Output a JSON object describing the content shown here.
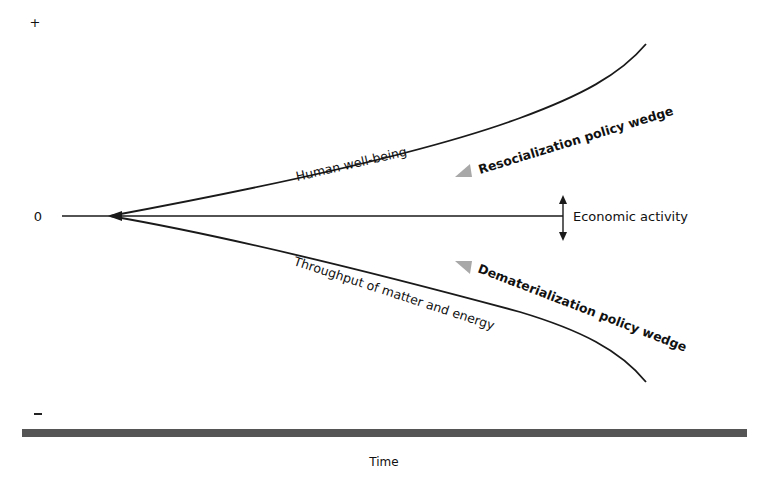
{
  "diagram": {
    "y_axis": {
      "top_label": "+",
      "zero_label": "0",
      "bottom_label": "–"
    },
    "x_axis": {
      "label": "Time"
    },
    "curves": {
      "upper": {
        "label": "Human well-being"
      },
      "middle": {
        "label": "Economic activity"
      },
      "lower": {
        "label": "Throughput of matter and energy"
      }
    },
    "wedges": {
      "upper": {
        "label": "Resocialization policy wedge",
        "color": "#a8a8a8"
      },
      "lower": {
        "label": "Dematerialization policy wedge",
        "color": "#a8a8a8"
      }
    },
    "colors": {
      "line": "#1a1a1a",
      "baseline_bar": "#555555"
    }
  }
}
